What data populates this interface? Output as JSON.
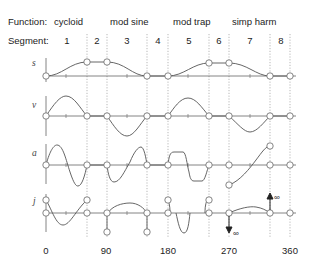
{
  "header": {
    "function_label": "Function:",
    "segment_label": "Segment:",
    "functions": [
      {
        "name": "cycloid",
        "x": 180
      },
      {
        "name": "mod sine",
        "x": 400
      },
      {
        "name": "mod trap",
        "x": 170
      },
      {
        "name": "simp harm",
        "x": 260
      }
    ],
    "segments": [
      "1",
      "2",
      "3",
      "4",
      "5",
      "6",
      "7",
      "8"
    ]
  },
  "rows": [
    {
      "key": "s",
      "label": "s"
    },
    {
      "key": "v",
      "label": "v"
    },
    {
      "key": "a",
      "label": "a"
    },
    {
      "key": "j",
      "label": "j"
    }
  ],
  "x_axis": {
    "ticks": [
      "0",
      "90",
      "180",
      "270",
      "360"
    ]
  },
  "annotations": {
    "infinity_up": "∞",
    "infinity_down": "∞"
  },
  "colors": {
    "curve": "#555555",
    "axis": "#666666",
    "guide": "#999999"
  }
}
